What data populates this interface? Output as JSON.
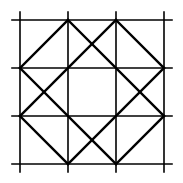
{
  "diagram": {
    "title": "",
    "stroke_color": "#000000",
    "background": "#ffffff",
    "grid_lines": {
      "vertical_x": [
        20,
        68,
        116,
        164
      ],
      "horizontal_y": [
        20,
        68,
        116,
        164
      ],
      "extent": [
        12,
        172
      ]
    },
    "diagonals": [
      [
        20,
        68,
        68,
        20
      ],
      [
        116,
        20,
        164,
        68
      ],
      [
        20,
        116,
        68,
        164
      ],
      [
        116,
        164,
        164,
        116
      ],
      [
        20,
        68,
        116,
        164
      ],
      [
        68,
        20,
        164,
        116
      ],
      [
        116,
        20,
        20,
        116
      ],
      [
        164,
        68,
        68,
        164
      ]
    ]
  }
}
